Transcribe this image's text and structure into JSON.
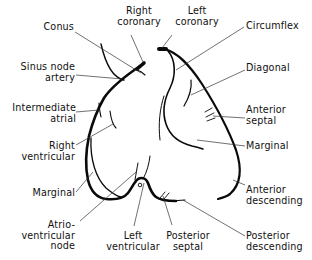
{
  "diagram": {
    "type": "anatomical-line-drawing",
    "colors": {
      "line": "#0a0a0a",
      "leader": "#333333",
      "background": "#ffffff",
      "text": "#111111"
    },
    "labels": {
      "right_coronary": "Right\ncoronary",
      "left_coronary": "Left\ncoronary",
      "conus": "Conus",
      "circumflex": "Circumflex",
      "sinus_node_artery": "Sinus node\nartery",
      "diagonal": "Diagonal",
      "intermediate_atrial": "Intermediate\natrial",
      "anterior_septal": "Anterior\nseptal",
      "right_ventricular": "Right\nventricular",
      "marginal_right": "Marginal",
      "marginal_left": "Marginal",
      "anterior_descending": "Anterior\ndescending",
      "atrioventricular_node": "Atrio-\nventricular\nnode",
      "left_ventricular": "Left\nventricular",
      "posterior_septal": "Posterior\nseptal",
      "posterior_descending": "Posterior\ndescending"
    }
  }
}
